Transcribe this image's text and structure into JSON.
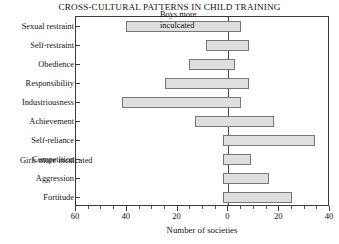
{
  "chart_data": {
    "type": "bar",
    "orientation": "horizontal",
    "title": "CROSS-CULTURAL PATTERNS IN CHILD TRAINING",
    "xlabel": "Number of societies",
    "ylabel": "",
    "categories": [
      "Sexual restraint",
      "Self-restraint",
      "Obedience",
      "Responsibility",
      "Industriousness",
      "Achievement",
      "Self-reliance",
      "Competition",
      "Aggression",
      "Fortitude"
    ],
    "series": [
      {
        "name": "Girls more inculcated",
        "direction": "left",
        "values": [
          40.5,
          9.0,
          15.5,
          25.0,
          42.0,
          13.0,
          2.0,
          2.0,
          2.0,
          2.0
        ]
      },
      {
        "name": "Boys more inculcated",
        "direction": "right",
        "values": [
          5.0,
          8.0,
          2.5,
          8.0,
          5.0,
          18.0,
          34.0,
          9.0,
          16.0,
          25.0
        ]
      }
    ],
    "xlim": [
      -60,
      40
    ],
    "x_tick_values": [
      -60,
      -40,
      -20,
      0,
      20,
      40
    ],
    "x_tick_labels": [
      "60",
      "40",
      "20",
      "0",
      "20",
      "40"
    ],
    "x_minor_tick_step": 5,
    "grid": false,
    "legend_position": "in-plot-annotations",
    "annotations": [
      {
        "id": "boys",
        "text_line1": "Boys more",
        "text_line2": "inculcated",
        "position": "top-right"
      },
      {
        "id": "girls",
        "text_line1": "Girls more inculcated",
        "text_line2": "",
        "position": "bottom-left"
      }
    ],
    "colors": {
      "bar_fill": "#dededc",
      "bar_edge": "#777777",
      "axis": "#3a3a3a",
      "text": "#121212",
      "background": "#ffffff"
    }
  }
}
